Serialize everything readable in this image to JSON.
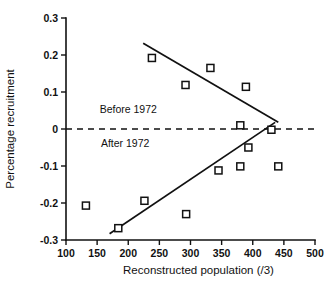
{
  "chart_data": {
    "type": "scatter",
    "title": "",
    "xlabel": "Reconstructed population (/3)",
    "ylabel": "Percentage recruitment",
    "xlim": [
      100,
      500
    ],
    "ylim": [
      -0.3,
      0.3
    ],
    "xticks": [
      100,
      150,
      200,
      250,
      300,
      350,
      400,
      450,
      500
    ],
    "xtick_labels": [
      "100",
      "150",
      "200",
      "250",
      "300",
      "350",
      "400",
      "450",
      "500"
    ],
    "yticks": [
      0.3,
      0.2,
      0.1,
      0,
      -0.1,
      -0.2,
      -0.3
    ],
    "ytick_labels": [
      "0.3",
      "0.2",
      "0.1",
      "0",
      "-0.1",
      "-0.2",
      "-0.3"
    ],
    "grid": false,
    "legend_position": "inline-annotation",
    "annotations": [
      {
        "name": "before-1972-label",
        "text": "Before 1972",
        "x": 200,
        "y": 0.043
      },
      {
        "name": "after-1972-label",
        "text": "After 1972",
        "x": 195,
        "y": -0.048
      }
    ],
    "reference_lines": [
      {
        "name": "zero-line",
        "orientation": "horizontal",
        "y": 0,
        "style": "dashed",
        "x_start": 100,
        "x_end": 500
      }
    ],
    "series": [
      {
        "name": "Before 1972",
        "marker": "open-square",
        "color": "#111111",
        "points": [
          {
            "x": 238,
            "y": 0.192
          },
          {
            "x": 292,
            "y": 0.119
          },
          {
            "x": 332,
            "y": 0.165
          },
          {
            "x": 389,
            "y": 0.114
          },
          {
            "x": 380,
            "y": 0.01
          },
          {
            "x": 430,
            "y": -0.002
          }
        ],
        "trend_line": {
          "x_start": 224,
          "y_start": 0.232,
          "x_end": 441,
          "y_end": 0.018,
          "slope": -0.00099
        }
      },
      {
        "name": "After 1972",
        "marker": "open-square",
        "color": "#111111",
        "points": [
          {
            "x": 132,
            "y": -0.207
          },
          {
            "x": 184,
            "y": -0.268
          },
          {
            "x": 226,
            "y": -0.194
          },
          {
            "x": 293,
            "y": -0.23
          },
          {
            "x": 345,
            "y": -0.112
          },
          {
            "x": 380,
            "y": -0.101
          },
          {
            "x": 393,
            "y": -0.05
          },
          {
            "x": 441,
            "y": -0.101
          }
        ],
        "trend_line": {
          "x_start": 170,
          "y_start": -0.283,
          "x_end": 436,
          "y_end": 0.018,
          "slope": 0.00113
        }
      }
    ]
  }
}
